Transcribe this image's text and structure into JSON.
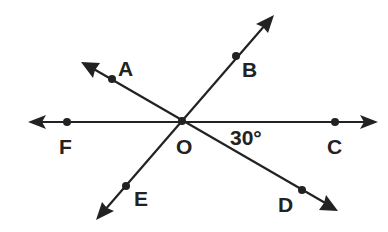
{
  "diagram": {
    "type": "intersecting-lines",
    "vertex": {
      "label": "O",
      "x": 182,
      "y": 121
    },
    "stroke_color": "#222222",
    "background": "#ffffff",
    "lines": [
      {
        "name": "line-FC",
        "from": [
          28,
          122
        ],
        "to": [
          378,
          122
        ]
      },
      {
        "name": "line-AD",
        "from": [
          81,
          62
        ],
        "to": [
          338,
          211
        ]
      },
      {
        "name": "line-EB",
        "from": [
          96,
          220
        ],
        "to": [
          274,
          15
        ]
      }
    ],
    "points": [
      {
        "label": "A",
        "x": 112,
        "y": 79,
        "label_x": 118,
        "label_y": 76
      },
      {
        "label": "B",
        "x": 236,
        "y": 56,
        "label_x": 242,
        "label_y": 77
      },
      {
        "label": "C",
        "x": 335,
        "y": 122,
        "label_x": 327,
        "label_y": 154
      },
      {
        "label": "D",
        "x": 302,
        "y": 190,
        "label_x": 278,
        "label_y": 212
      },
      {
        "label": "E",
        "x": 126,
        "y": 186,
        "label_x": 134,
        "label_y": 206
      },
      {
        "label": "F",
        "x": 67,
        "y": 122,
        "label_x": 59,
        "label_y": 154
      },
      {
        "label": "O",
        "x": 182,
        "y": 121,
        "label_x": 176,
        "label_y": 154
      }
    ],
    "angle_label": {
      "text": "30°",
      "x": 230,
      "y": 145
    }
  },
  "labels": {
    "A": "A",
    "B": "B",
    "C": "C",
    "D": "D",
    "E": "E",
    "F": "F",
    "O": "O",
    "angle": "30°"
  }
}
